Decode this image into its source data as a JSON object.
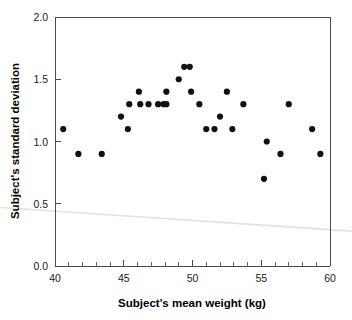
{
  "chart_data": {
    "type": "scatter",
    "title": "",
    "xlabel": "Subject's mean weight (kg)",
    "ylabel": "Subject's standard deviation",
    "xlim": [
      40,
      60
    ],
    "ylim": [
      0.0,
      2.0
    ],
    "x_ticks": [
      40,
      45,
      50,
      55,
      60
    ],
    "x_tick_labels": [
      "40",
      "45",
      "50",
      "55",
      "60"
    ],
    "x_minor_tick_step": 1,
    "y_ticks": [
      0.0,
      0.5,
      1.0,
      1.5,
      2.0
    ],
    "y_tick_labels": [
      "0.0",
      "0.5",
      "1.0",
      "1.5",
      "2.0"
    ],
    "grid": false,
    "legend": null,
    "marker": "filled-circle",
    "marker_color": "#111111",
    "points": [
      {
        "x": 40.6,
        "y": 1.1
      },
      {
        "x": 41.7,
        "y": 0.9
      },
      {
        "x": 43.4,
        "y": 0.9
      },
      {
        "x": 44.8,
        "y": 1.2
      },
      {
        "x": 45.3,
        "y": 1.1
      },
      {
        "x": 45.4,
        "y": 1.3
      },
      {
        "x": 46.1,
        "y": 1.4
      },
      {
        "x": 46.2,
        "y": 1.3
      },
      {
        "x": 46.8,
        "y": 1.3
      },
      {
        "x": 47.5,
        "y": 1.3
      },
      {
        "x": 47.9,
        "y": 1.3
      },
      {
        "x": 48.1,
        "y": 1.3
      },
      {
        "x": 48.1,
        "y": 1.4
      },
      {
        "x": 49.0,
        "y": 1.5
      },
      {
        "x": 49.4,
        "y": 1.6
      },
      {
        "x": 49.8,
        "y": 1.6
      },
      {
        "x": 49.9,
        "y": 1.4
      },
      {
        "x": 50.5,
        "y": 1.3
      },
      {
        "x": 51.0,
        "y": 1.1
      },
      {
        "x": 51.6,
        "y": 1.1
      },
      {
        "x": 52.0,
        "y": 1.2
      },
      {
        "x": 52.5,
        "y": 1.4
      },
      {
        "x": 52.9,
        "y": 1.1
      },
      {
        "x": 53.7,
        "y": 1.3
      },
      {
        "x": 55.2,
        "y": 0.7
      },
      {
        "x": 55.4,
        "y": 1.0
      },
      {
        "x": 56.4,
        "y": 0.9
      },
      {
        "x": 57.0,
        "y": 1.3
      },
      {
        "x": 58.7,
        "y": 1.1
      },
      {
        "x": 59.3,
        "y": 0.9
      }
    ],
    "artifact": {
      "name": "scan-streak",
      "description": "faint light-gray diagonal scan line across the lower plot area",
      "color": "#e2e2e2",
      "y_left": 0.47,
      "y_right": 0.28
    }
  }
}
